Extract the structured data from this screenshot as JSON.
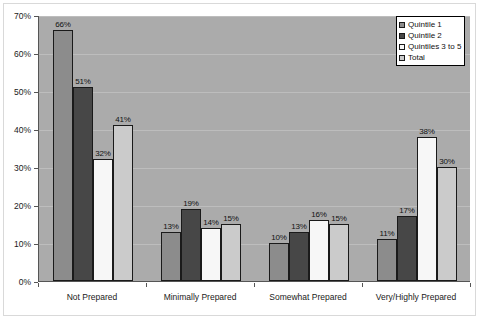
{
  "chart_data": {
    "type": "bar",
    "title": "",
    "xlabel": "",
    "ylabel": "",
    "ylim": [
      0,
      70
    ],
    "ytick_labels": [
      "0%",
      "10%",
      "20%",
      "30%",
      "40%",
      "50%",
      "60%",
      "70%"
    ],
    "ytick_values": [
      0,
      10,
      20,
      30,
      40,
      50,
      60,
      70
    ],
    "grid": true,
    "legend_position": "top-right",
    "categories": [
      "Not Prepared",
      "Minimally Prepared",
      "Somewhat Prepared",
      "Very/Highly Prepared"
    ],
    "series": [
      {
        "name": "Quintile 1",
        "color": "#8c8c8c",
        "values": [
          66,
          13,
          10,
          11
        ],
        "labels": [
          "66%",
          "13%",
          "10%",
          "11%"
        ]
      },
      {
        "name": "Quintile 2",
        "color": "#474747",
        "values": [
          51,
          19,
          13,
          17
        ],
        "labels": [
          "51%",
          "19%",
          "13%",
          "17%"
        ]
      },
      {
        "name": "Quintiles 3 to 5",
        "color": "#f7f7f7",
        "values": [
          32,
          14,
          16,
          38
        ],
        "labels": [
          "32%",
          "14%",
          "16%",
          "38%"
        ]
      },
      {
        "name": "Total",
        "color": "#cbcbcb",
        "values": [
          41,
          15,
          15,
          30
        ],
        "labels": [
          "41%",
          "15%",
          "15%",
          "30%"
        ]
      }
    ],
    "plot_background_color": "#ababab",
    "gridline_color": "#bdbdbd",
    "axis_color": "#555555"
  }
}
